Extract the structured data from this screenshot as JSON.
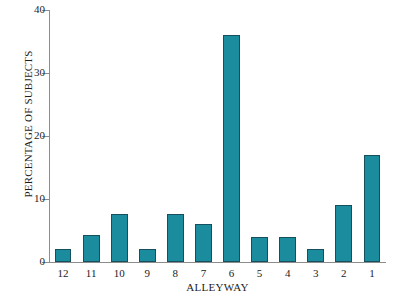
{
  "chart_data": {
    "type": "bar",
    "title": "",
    "xlabel": "ALLEYWAY",
    "ylabel": "PERCENTAGE OF SUBJECTS",
    "categories": [
      "12",
      "11",
      "10",
      "9",
      "8",
      "7",
      "6",
      "5",
      "4",
      "3",
      "2",
      "1"
    ],
    "values": [
      2,
      4.3,
      7.7,
      2,
      7.6,
      6,
      36,
      4,
      4,
      2,
      9,
      17
    ],
    "ylim": [
      0,
      40
    ],
    "yticks": [
      0,
      10,
      20,
      30,
      40
    ],
    "ytick_labels": [
      "0",
      "10",
      "20",
      "30",
      "40"
    ],
    "grid": false,
    "legend": null,
    "bar_color": "#1a8c9e",
    "bar_edge_color": "#16505e",
    "axis_color": "#8d8d8d",
    "background": "#ffffff"
  }
}
